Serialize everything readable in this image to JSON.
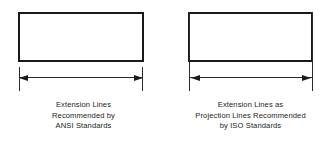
{
  "figure": {
    "background_color": "#ffffff",
    "line_color": "#2b2b2b",
    "object_color": "#1a1a1a",
    "text_color": "#1c1c1c"
  },
  "panels": [
    {
      "id": "ansi",
      "standard": "ANSI",
      "extension_line_style": "gapped",
      "caption_lines": [
        "Extension Lines",
        "Recommended by",
        "ANSI Standards"
      ]
    },
    {
      "id": "iso",
      "standard": "ISO",
      "extension_line_style": "continuous",
      "caption_lines": [
        "Extension Lines as",
        "Projection Lines Recommended",
        "by ISO Standards"
      ]
    }
  ]
}
